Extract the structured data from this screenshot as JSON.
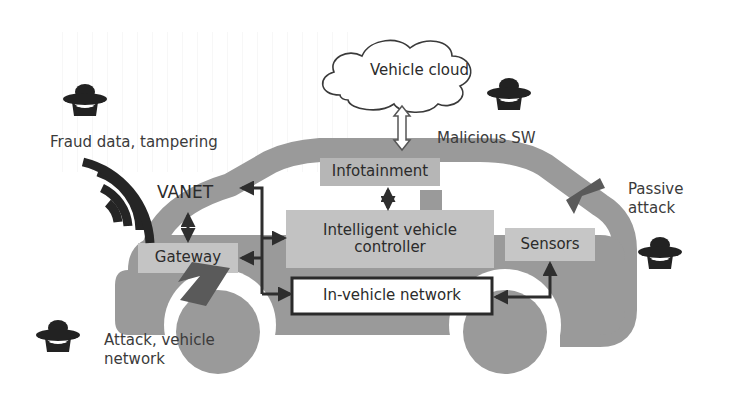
{
  "diagram": {
    "cloud": {
      "label": "Vehicle cloud"
    },
    "components": {
      "infotainment": "Infotainment",
      "controller_line1": "Intelligent vehicle",
      "controller_line2": "controller",
      "gateway": "Gateway",
      "sensors": "Sensors",
      "in_vehicle_network": "In-vehicle network",
      "vanet": "VANET"
    },
    "threats": {
      "fraud": "Fraud data, tampering",
      "malicious": "Malicious SW",
      "passive_line1": "Passive",
      "passive_line2": "attack",
      "attack_line1": "Attack, vehicle",
      "attack_line2": "network"
    },
    "icons": {
      "hacker": "hacker-icon",
      "wireless": "wireless-signal-icon",
      "cloud": "cloud-icon",
      "car": "vehicle-silhouette"
    },
    "colors": {
      "car_body": "#9a9a9a",
      "component_fill": "#bdbdbd",
      "arrow": "#2e2e2e",
      "hacker": "#222222",
      "text": "#3b3b3b"
    }
  }
}
